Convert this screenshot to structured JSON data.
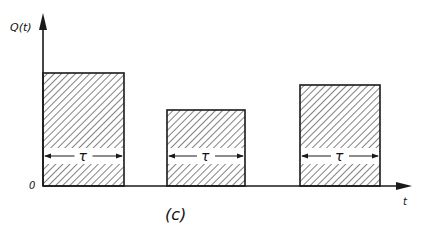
{
  "figure": {
    "y_axis_label": "Q(t)",
    "x_axis_label": "t",
    "origin_label": "0",
    "caption": "(c)",
    "tau_symbol": "τ",
    "colors": {
      "ink": "#1a1a1a",
      "background": "#ffffff"
    }
  },
  "pulses": [
    {
      "name": "pulse-1",
      "x0": 43,
      "x1": 124,
      "top": 73,
      "width_label": "τ"
    },
    {
      "name": "pulse-2",
      "x0": 167,
      "x1": 245,
      "top": 110,
      "width_label": "τ"
    },
    {
      "name": "pulse-3",
      "x0": 300,
      "x1": 380,
      "top": 85,
      "width_label": "τ"
    }
  ]
}
